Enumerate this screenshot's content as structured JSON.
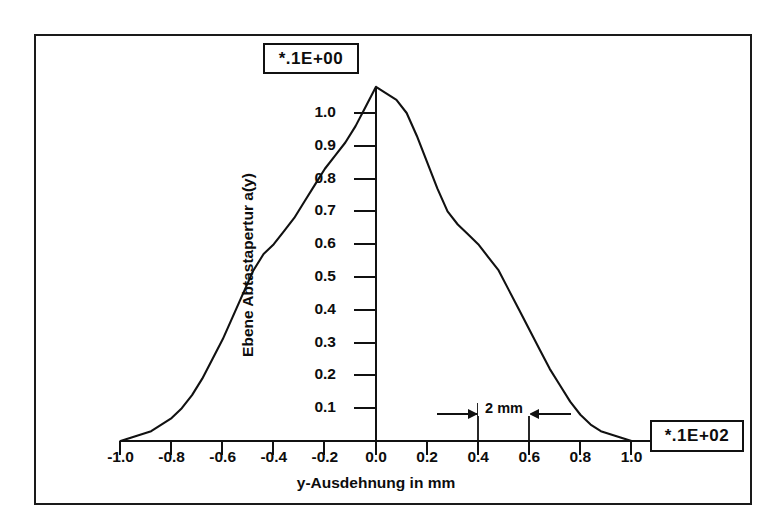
{
  "figure": {
    "exponent_box_y": "*.1E+00",
    "exponent_box_x": "*.1E+02",
    "xaxis_title": "y-Ausdehnung  in  mm",
    "yaxis_title": "Ebene  Abtastapertur  a(y)",
    "dimension_annotation": "2 mm"
  },
  "chart_data": {
    "type": "line",
    "title": "",
    "subtitle": "",
    "xlabel": "y-Ausdehnung  in  mm",
    "ylabel": "Ebene  Abtastapertur  a(y)",
    "xlim": [
      -1.0,
      1.0
    ],
    "ylim": [
      0.0,
      1.1
    ],
    "xticks": [
      -1.0,
      -0.8,
      -0.6,
      -0.4,
      -0.2,
      0.0,
      0.2,
      0.4,
      0.6,
      0.8,
      1.0
    ],
    "xtick_labels": [
      "-1.0",
      "-0.8",
      "-0.6",
      "-0.4",
      "-0.2",
      "0.0",
      "0.2",
      "0.4",
      "0.6",
      "0.8",
      "1.0"
    ],
    "yticks": [
      0.1,
      0.2,
      0.3,
      0.4,
      0.5,
      0.6,
      0.7,
      0.8,
      0.9,
      1.0
    ],
    "ytick_labels": [
      "0.1",
      "0.2",
      "0.3",
      "0.4",
      "0.5",
      "0.6",
      "0.7",
      "0.8",
      "0.9",
      "1.0"
    ],
    "x_multiplier": "*.1E+02",
    "y_multiplier": "*.1E+00",
    "grid": false,
    "legend": "none",
    "annotations": [
      {
        "text": "2 mm",
        "type": "dimension-arrow",
        "x_from": 0.4,
        "x_to": 0.62,
        "y": 0.12
      }
    ],
    "series": [
      {
        "name": "a(y)",
        "x": [
          -1.0,
          -0.96,
          -0.92,
          -0.88,
          -0.84,
          -0.8,
          -0.76,
          -0.72,
          -0.68,
          -0.64,
          -0.6,
          -0.56,
          -0.52,
          -0.48,
          -0.44,
          -0.4,
          -0.36,
          -0.32,
          -0.28,
          -0.24,
          -0.2,
          -0.16,
          -0.12,
          -0.08,
          -0.04,
          0.0,
          0.04,
          0.08,
          0.12,
          0.16,
          0.2,
          0.24,
          0.28,
          0.32,
          0.36,
          0.4,
          0.44,
          0.48,
          0.52,
          0.56,
          0.6,
          0.64,
          0.68,
          0.72,
          0.76,
          0.8,
          0.84,
          0.88,
          0.92,
          0.96,
          1.0
        ],
        "y": [
          0.0,
          0.01,
          0.02,
          0.03,
          0.05,
          0.07,
          0.1,
          0.14,
          0.19,
          0.25,
          0.31,
          0.38,
          0.45,
          0.52,
          0.57,
          0.6,
          0.64,
          0.68,
          0.73,
          0.78,
          0.83,
          0.87,
          0.91,
          0.96,
          1.02,
          1.08,
          1.06,
          1.04,
          1.0,
          0.93,
          0.85,
          0.77,
          0.7,
          0.66,
          0.63,
          0.6,
          0.56,
          0.52,
          0.46,
          0.4,
          0.34,
          0.28,
          0.22,
          0.17,
          0.12,
          0.08,
          0.05,
          0.03,
          0.02,
          0.01,
          0.0
        ]
      }
    ]
  }
}
